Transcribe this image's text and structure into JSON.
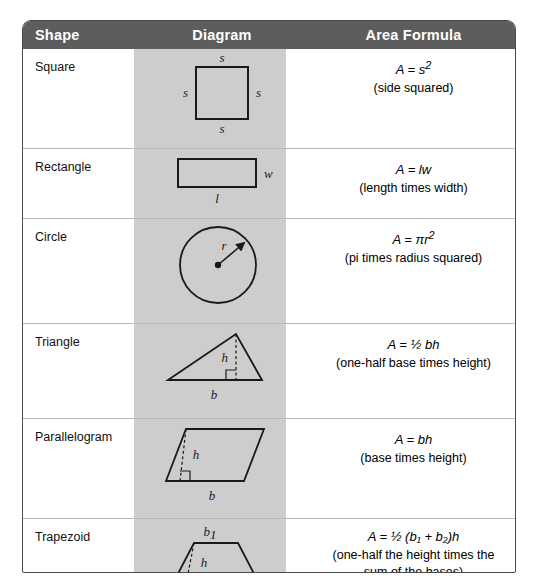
{
  "table": {
    "headers": {
      "shape": "Shape",
      "diagram": "Diagram",
      "formula": "Area Formula"
    },
    "colors": {
      "header_bg": "#5d5d5d",
      "header_text": "#ffffff",
      "diagram_band": "#cdcdcd",
      "border": "#4a4a4a",
      "row_divider": "#b9b9b9"
    },
    "rows": [
      {
        "shape": "Square",
        "diagram": {
          "type": "square-icon",
          "labels": [
            "s",
            "s",
            "s",
            "s"
          ],
          "label_positions": [
            "top",
            "left",
            "right",
            "bottom"
          ]
        },
        "formula": "A = s",
        "formula_exponent": "2",
        "description": "(side squared)"
      },
      {
        "shape": "Rectangle",
        "diagram": {
          "type": "rectangle-icon",
          "labels": [
            "w",
            "l"
          ],
          "label_positions": [
            "right",
            "bottom"
          ]
        },
        "formula": "A = lw",
        "formula_exponent": "",
        "description": "(length times width)"
      },
      {
        "shape": "Circle",
        "diagram": {
          "type": "circle-icon",
          "labels": [
            "r"
          ],
          "label_positions": [
            "radius"
          ]
        },
        "formula": "A = πr",
        "formula_exponent": "2",
        "description": "(pi times radius squared)"
      },
      {
        "shape": "Triangle",
        "diagram": {
          "type": "triangle-icon",
          "labels": [
            "h",
            "b"
          ],
          "label_positions": [
            "height",
            "base"
          ]
        },
        "formula": "A = ½ bh",
        "formula_exponent": "",
        "description": "(one-half base times height)"
      },
      {
        "shape": "Parallelogram",
        "diagram": {
          "type": "parallelogram-icon",
          "labels": [
            "h",
            "b"
          ],
          "label_positions": [
            "height",
            "base"
          ]
        },
        "formula": "A = bh",
        "formula_exponent": "",
        "description": "(base times height)"
      },
      {
        "shape": "Trapezoid",
        "diagram": {
          "type": "trapezoid-icon",
          "labels": [
            "b₁",
            "h",
            "b₂"
          ],
          "label_positions": [
            "top-base",
            "height",
            "bottom-base"
          ]
        },
        "formula": "A = ½ (b₁ + b₂)h",
        "formula_exponent": "",
        "description": "(one-half the height times the sum of the bases)",
        "description_line1": "(one-half the height times the",
        "description_line2": "sum of the bases)"
      }
    ]
  },
  "diagram_labels": {
    "square": {
      "top": "s",
      "left": "s",
      "right": "s",
      "bottom": "s"
    },
    "rectangle": {
      "right": "w",
      "bottom": "l"
    },
    "circle": {
      "radius": "r"
    },
    "triangle": {
      "height": "h",
      "base": "b"
    },
    "parallelogram": {
      "height": "h",
      "base": "b"
    },
    "trapezoid": {
      "top": "b",
      "top_sub": "1",
      "height": "h",
      "bottom": "b",
      "bottom_sub": "2"
    }
  },
  "formula_parts": {
    "square": {
      "lhs": "A",
      "eq": "=",
      "var": "s",
      "exp": "2"
    },
    "rectangle": {
      "lhs": "A",
      "eq": "=",
      "var": "lw",
      "exp": ""
    },
    "circle": {
      "lhs": "A",
      "eq": "=",
      "var": "πr",
      "exp": "2"
    },
    "triangle": {
      "lhs": "A",
      "eq": "=",
      "var": "½ bh",
      "exp": ""
    },
    "parallelogram": {
      "lhs": "A",
      "eq": "=",
      "var": "bh",
      "exp": ""
    },
    "trapezoid": {
      "lhs": "A",
      "eq": "=",
      "prefix": "½ (",
      "b1": "b",
      "b1s": "1",
      "plus": "+",
      "b2": "b",
      "b2s": "2",
      "suffix": ")h"
    }
  }
}
